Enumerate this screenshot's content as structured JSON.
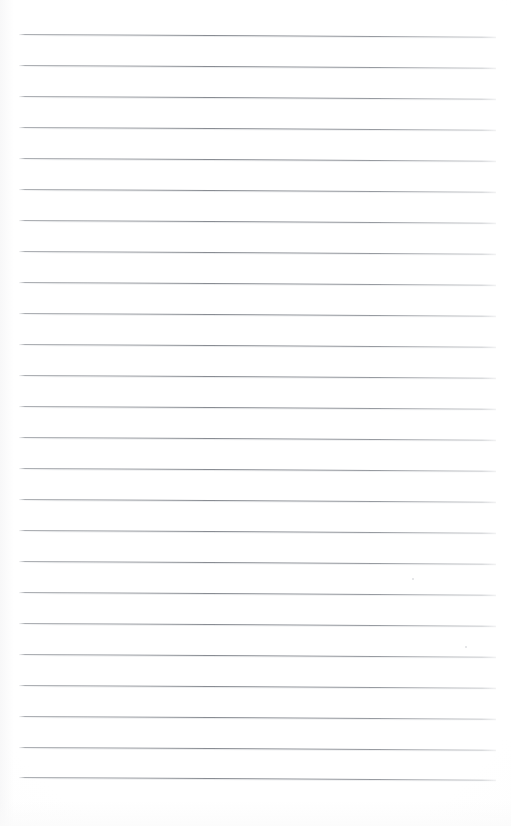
{
  "document": {
    "kind": "scanned-lined-paper",
    "title": "Blank Lined Notebook Page",
    "description": "Scan of a blank ruled writing-paper sheet",
    "page_text": "",
    "visible_text": "",
    "background_color": "#ffffff",
    "page_width": 511,
    "page_height": 826
  },
  "ruling": {
    "line_color": "#7e828a",
    "line_count": 25,
    "line_thickness_px": 1,
    "line_spacing_px": 31,
    "first_line_y": 34,
    "left_margin_x": 19,
    "right_margin_x": 496,
    "slope_deg": 0.32,
    "lines": [
      {
        "index": 1,
        "y": 34
      },
      {
        "index": 2,
        "y": 65
      },
      {
        "index": 3,
        "y": 96
      },
      {
        "index": 4,
        "y": 127
      },
      {
        "index": 5,
        "y": 158
      },
      {
        "index": 6,
        "y": 189
      },
      {
        "index": 7,
        "y": 220
      },
      {
        "index": 8,
        "y": 251
      },
      {
        "index": 9,
        "y": 282
      },
      {
        "index": 10,
        "y": 313
      },
      {
        "index": 11,
        "y": 344
      },
      {
        "index": 12,
        "y": 375
      },
      {
        "index": 13,
        "y": 406
      },
      {
        "index": 14,
        "y": 437
      },
      {
        "index": 15,
        "y": 468
      },
      {
        "index": 16,
        "y": 499
      },
      {
        "index": 17,
        "y": 530
      },
      {
        "index": 18,
        "y": 561
      },
      {
        "index": 19,
        "y": 592
      },
      {
        "index": 20,
        "y": 623
      },
      {
        "index": 21,
        "y": 654
      },
      {
        "index": 22,
        "y": 685
      },
      {
        "index": 23,
        "y": 716
      },
      {
        "index": 24,
        "y": 747
      },
      {
        "index": 25,
        "y": 777
      }
    ]
  },
  "artifacts": {
    "specks": [
      {
        "x": 412,
        "y": 578,
        "size": 2
      },
      {
        "x": 465,
        "y": 646,
        "size": 2
      }
    ]
  }
}
